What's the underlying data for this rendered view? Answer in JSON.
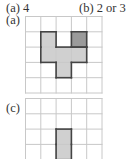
{
  "answers": {
    "a": "(a) 4",
    "b": "(b) 2 or 3"
  },
  "figures": [
    {
      "label": "(a)",
      "rows": 5,
      "cols": 5,
      "cell": 15.3,
      "light_cells": [
        [
          1,
          1
        ],
        [
          2,
          1
        ],
        [
          2,
          2
        ],
        [
          2,
          3
        ],
        [
          3,
          2
        ]
      ],
      "dark_cells": [
        [
          1,
          3
        ]
      ],
      "light_color": "#d0d0d0",
      "dark_color": "#9a9a9a"
    },
    {
      "label": "(c)",
      "rows": 4,
      "cols": 5,
      "cell": 15.3,
      "light_cells": [
        [
          2,
          2
        ],
        [
          3,
          2
        ]
      ],
      "dark_cells": [],
      "light_color": "#d0d0d0",
      "dark_color": "#9a9a9a"
    }
  ],
  "colors": {
    "grid_line": "#c8c8c8",
    "outline": "#444444"
  }
}
